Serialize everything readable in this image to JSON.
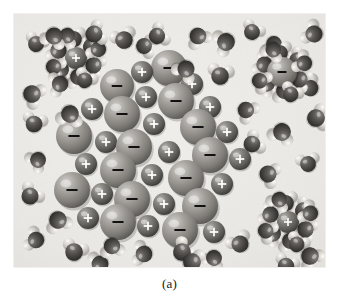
{
  "figure": {
    "caption": "(a)",
    "plate": {
      "background_color": "#eceae6",
      "width": 311,
      "height": 253,
      "left": 14,
      "top": 14
    },
    "colors": {
      "background": "#eceae6",
      "page": "#ffffff",
      "anion_sphere": "#9b9893",
      "anion_sphere_dark": "#6e6b67",
      "cation_sphere": "#75726e",
      "cation_sphere_dark": "#4e4b48",
      "oxygen": "#4a4745",
      "hydrogen": "#d8d5d0",
      "plus_label": "#ffffff",
      "minus_label": "#111111",
      "caption_text": "#1a1a1a"
    },
    "legend_symbols": {
      "positive": "+",
      "negative": "–"
    }
  },
  "chart_data": {
    "type": "scatter",
    "xlabel": "",
    "ylabel": "",
    "crystal_ions": [
      {
        "x": 128,
        "y": 58,
        "r": 11,
        "charge": "+",
        "kind": "cation"
      },
      {
        "x": 155,
        "y": 54,
        "r": 18,
        "charge": "–",
        "kind": "anion"
      },
      {
        "x": 103,
        "y": 72,
        "r": 17,
        "charge": "–",
        "kind": "anion"
      },
      {
        "x": 178,
        "y": 70,
        "r": 11,
        "charge": "+",
        "kind": "cation"
      },
      {
        "x": 132,
        "y": 83,
        "r": 11,
        "charge": "+",
        "kind": "cation"
      },
      {
        "x": 162,
        "y": 87,
        "r": 18,
        "charge": "–",
        "kind": "anion"
      },
      {
        "x": 78,
        "y": 95,
        "r": 11,
        "charge": "+",
        "kind": "cation"
      },
      {
        "x": 108,
        "y": 100,
        "r": 18,
        "charge": "–",
        "kind": "anion"
      },
      {
        "x": 196,
        "y": 93,
        "r": 11,
        "charge": "+",
        "kind": "cation"
      },
      {
        "x": 140,
        "y": 110,
        "r": 11,
        "charge": "+",
        "kind": "cation"
      },
      {
        "x": 184,
        "y": 113,
        "r": 18,
        "charge": "–",
        "kind": "anion"
      },
      {
        "x": 60,
        "y": 122,
        "r": 18,
        "charge": "–",
        "kind": "anion"
      },
      {
        "x": 92,
        "y": 128,
        "r": 11,
        "charge": "+",
        "kind": "cation"
      },
      {
        "x": 120,
        "y": 133,
        "r": 18,
        "charge": "–",
        "kind": "anion"
      },
      {
        "x": 213,
        "y": 118,
        "r": 11,
        "charge": "+",
        "kind": "cation"
      },
      {
        "x": 155,
        "y": 138,
        "r": 11,
        "charge": "+",
        "kind": "cation"
      },
      {
        "x": 196,
        "y": 141,
        "r": 18,
        "charge": "–",
        "kind": "anion"
      },
      {
        "x": 72,
        "y": 150,
        "r": 11,
        "charge": "+",
        "kind": "cation"
      },
      {
        "x": 104,
        "y": 156,
        "r": 18,
        "charge": "–",
        "kind": "anion"
      },
      {
        "x": 138,
        "y": 161,
        "r": 11,
        "charge": "+",
        "kind": "cation"
      },
      {
        "x": 226,
        "y": 145,
        "r": 11,
        "charge": "+",
        "kind": "cation"
      },
      {
        "x": 172,
        "y": 164,
        "r": 18,
        "charge": "–",
        "kind": "anion"
      },
      {
        "x": 58,
        "y": 176,
        "r": 18,
        "charge": "–",
        "kind": "anion"
      },
      {
        "x": 88,
        "y": 180,
        "r": 11,
        "charge": "+",
        "kind": "cation"
      },
      {
        "x": 118,
        "y": 185,
        "r": 18,
        "charge": "–",
        "kind": "anion"
      },
      {
        "x": 208,
        "y": 170,
        "r": 11,
        "charge": "+",
        "kind": "cation"
      },
      {
        "x": 150,
        "y": 190,
        "r": 11,
        "charge": "+",
        "kind": "cation"
      },
      {
        "x": 186,
        "y": 192,
        "r": 18,
        "charge": "–",
        "kind": "anion"
      },
      {
        "x": 74,
        "y": 204,
        "r": 11,
        "charge": "+",
        "kind": "cation"
      },
      {
        "x": 104,
        "y": 208,
        "r": 18,
        "charge": "–",
        "kind": "anion"
      },
      {
        "x": 134,
        "y": 212,
        "r": 11,
        "charge": "+",
        "kind": "cation"
      },
      {
        "x": 166,
        "y": 216,
        "r": 18,
        "charge": "–",
        "kind": "anion"
      },
      {
        "x": 200,
        "y": 218,
        "r": 11,
        "charge": "+",
        "kind": "cation"
      }
    ],
    "hydrated_ions": [
      {
        "x": 62,
        "y": 44,
        "charge": "+",
        "label": "hydrated-cation-upper-left"
      },
      {
        "x": 268,
        "y": 58,
        "charge": "–",
        "label": "hydrated-anion-upper-right"
      },
      {
        "x": 274,
        "y": 208,
        "charge": "+",
        "label": "hydrated-cation-lower-right"
      }
    ],
    "water_molecules": [
      {
        "x": 22,
        "y": 30,
        "rot": 20
      },
      {
        "x": 40,
        "y": 22,
        "rot": 200
      },
      {
        "x": 110,
        "y": 26,
        "rot": 340
      },
      {
        "x": 143,
        "y": 22,
        "rot": 60
      },
      {
        "x": 184,
        "y": 22,
        "rot": 150
      },
      {
        "x": 212,
        "y": 28,
        "rot": 250
      },
      {
        "x": 238,
        "y": 18,
        "rot": 30
      },
      {
        "x": 300,
        "y": 20,
        "rot": 300
      },
      {
        "x": 18,
        "y": 80,
        "rot": 120
      },
      {
        "x": 46,
        "y": 70,
        "rot": 260
      },
      {
        "x": 20,
        "y": 110,
        "rot": 15
      },
      {
        "x": 56,
        "y": 100,
        "rot": 190
      },
      {
        "x": 130,
        "y": 32,
        "rot": 95
      },
      {
        "x": 172,
        "y": 55,
        "rot": 215
      },
      {
        "x": 206,
        "y": 62,
        "rot": 10
      },
      {
        "x": 232,
        "y": 96,
        "rot": 130
      },
      {
        "x": 296,
        "y": 74,
        "rot": 320
      },
      {
        "x": 302,
        "y": 104,
        "rot": 80
      },
      {
        "x": 24,
        "y": 146,
        "rot": 230
      },
      {
        "x": 16,
        "y": 182,
        "rot": 40
      },
      {
        "x": 44,
        "y": 206,
        "rot": 160
      },
      {
        "x": 22,
        "y": 226,
        "rot": 290
      },
      {
        "x": 238,
        "y": 130,
        "rot": 60
      },
      {
        "x": 268,
        "y": 118,
        "rot": 200
      },
      {
        "x": 294,
        "y": 150,
        "rot": 350
      },
      {
        "x": 254,
        "y": 160,
        "rot": 110
      },
      {
        "x": 60,
        "y": 238,
        "rot": 20
      },
      {
        "x": 98,
        "y": 232,
        "rot": 170
      },
      {
        "x": 130,
        "y": 240,
        "rot": 280
      },
      {
        "x": 168,
        "y": 238,
        "rot": 50
      },
      {
        "x": 200,
        "y": 244,
        "rot": 210
      },
      {
        "x": 226,
        "y": 230,
        "rot": 330
      },
      {
        "x": 296,
        "y": 242,
        "rot": 140
      },
      {
        "x": 272,
        "y": 252,
        "rot": 20
      },
      {
        "x": 86,
        "y": 250,
        "rot": 260
      },
      {
        "x": 178,
        "y": 248,
        "rot": 100
      },
      {
        "x": 260,
        "y": 30,
        "rot": 180
      },
      {
        "x": 80,
        "y": 20,
        "rot": 70
      }
    ]
  }
}
